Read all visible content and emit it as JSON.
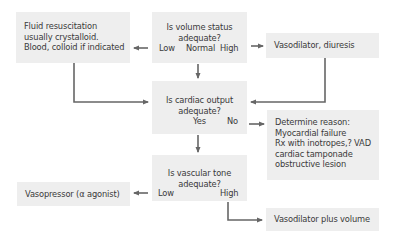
{
  "nodes": {
    "fluid": {
      "lines": [
        "Fluid resuscitation",
        "usually crystalloid.",
        "Blood, colloid if indicated"
      ]
    },
    "volume_status": {
      "lines": [
        "Is volume status",
        "adequate?"
      ],
      "options": {
        "low": "Low",
        "normal": "Normal",
        "high": "High"
      }
    },
    "vasodilator_diuresis": {
      "lines": [
        "Vasodilator, diuresis"
      ]
    },
    "cardiac_output": {
      "lines": [
        "Is cardiac output",
        "adequate?"
      ],
      "options": {
        "yes": "Yes",
        "no": "No"
      }
    },
    "determine_reason": {
      "lines": [
        "Determine reason:",
        "Myocardial failure",
        "Rx with inotropes,? VAD",
        "cardiac tamponade",
        "obstructive lesion"
      ]
    },
    "vascular_tone": {
      "lines": [
        "Is vascular tone",
        "adequate?"
      ],
      "options": {
        "low": "Low",
        "high": "High"
      }
    },
    "vasopressor": {
      "lines": [
        "Vasopressor (α agonist)"
      ]
    },
    "vasodilator_volume": {
      "lines": [
        "Vasodilator plus volume"
      ]
    }
  },
  "colors": {
    "box_fill": "#eeeeee",
    "arrow": "#666666",
    "text": "#3a3a3a"
  }
}
